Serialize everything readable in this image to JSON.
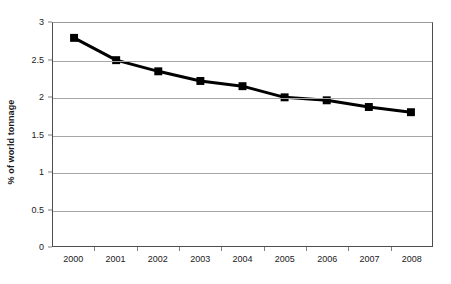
{
  "chart_data": {
    "type": "line",
    "title": "",
    "xlabel": "",
    "ylabel": "% of world tonnage",
    "categories": [
      "2000",
      "2001",
      "2002",
      "2003",
      "2004",
      "2005",
      "2006",
      "2007",
      "2008"
    ],
    "values": [
      2.8,
      2.5,
      2.35,
      2.22,
      2.15,
      2.0,
      1.96,
      1.87,
      1.8
    ],
    "series": [
      {
        "name": "% of world tonnage",
        "values": [
          2.8,
          2.5,
          2.35,
          2.22,
          2.15,
          2.0,
          1.96,
          1.87,
          1.8
        ],
        "color": "#000000",
        "marker": "square",
        "line_width": 3
      }
    ],
    "ylim": [
      0,
      3
    ],
    "ytick_labels": [
      "0",
      "0.5",
      "1",
      "1.5",
      "2",
      "2.5",
      "3"
    ],
    "ytick_values": [
      0,
      0.5,
      1,
      1.5,
      2,
      2.5,
      3
    ],
    "grid": "horizontal",
    "grid_color": "#a6a6a6",
    "legend": "none",
    "plot_border_color": "#4d4d4d",
    "background_color": "#ffffff"
  }
}
